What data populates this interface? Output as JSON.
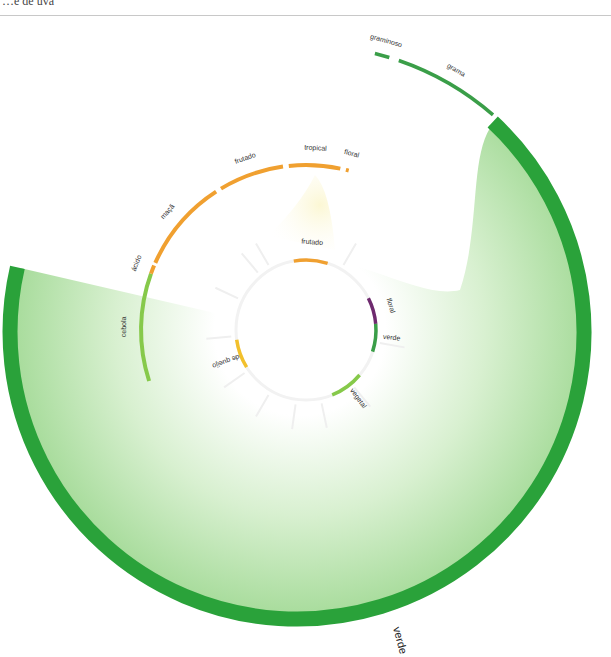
{
  "header": {
    "title_fragment": "…e de uva"
  },
  "diagram": {
    "type": "radial-flavor-wheel",
    "center": [
      300,
      330
    ],
    "colors": {
      "verde_dark": "#2aa23a",
      "verde_mid": "#3a9e48",
      "verde_light": "#86c94a",
      "orange": "#f0a030",
      "yellow": "#f2c02c",
      "purple": "#6e2a6e",
      "faint": "#f0f0f0"
    },
    "inner_ring": {
      "segments": [
        {
          "label": "frutado",
          "color": "#f0a030",
          "start": -10,
          "end": 18
        },
        {
          "label": "floral",
          "color": "#6e2a6e",
          "start": 63,
          "end": 85
        },
        {
          "label": "verde",
          "color": "#3a9e48",
          "start": 85,
          "end": 108
        },
        {
          "label": "vegetal",
          "color": "#86c94a",
          "start": 130,
          "end": 158
        },
        {
          "label": "de queijo",
          "color": "#f2c02c",
          "start": 238,
          "end": 262
        }
      ]
    },
    "middle_ring": {
      "segments": [
        {
          "label": "cebola",
          "color": "#86c94a",
          "start": 252,
          "end": 290
        },
        {
          "label": "ácido",
          "color": "#f0a030",
          "start": 290,
          "end": 293
        },
        {
          "label": "maçã",
          "color": "#f0a030",
          "start": 294,
          "end": 327
        },
        {
          "label": "frutado",
          "color": "#f0a030",
          "start": 329,
          "end": 352
        },
        {
          "label": "tropical",
          "color": "#f0a030",
          "start": 354,
          "end": 372
        },
        {
          "label": "floral",
          "color": "#f0a030",
          "start": 374,
          "end": 375
        }
      ]
    },
    "outer_ring": {
      "segments": [
        {
          "label": "graminoso",
          "color": "#3a9e48",
          "start": 14,
          "end": 17
        },
        {
          "label": "grama",
          "color": "#3a9e48",
          "start": 19,
          "end": 41
        }
      ]
    },
    "expanded_arc": {
      "label": "verde",
      "color": "#2aa23a",
      "start": 43,
      "end": 283
    }
  }
}
